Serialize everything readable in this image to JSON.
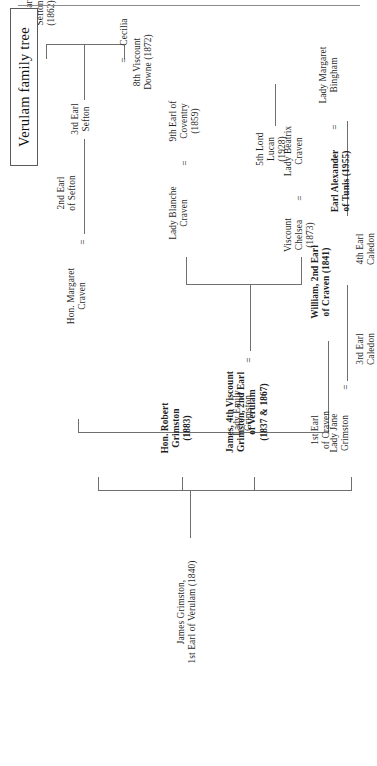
{
  "document": {
    "title": "Verulam family tree",
    "rule_color": "#8b8b8b",
    "line_color": "#6f6f6f",
    "text_color": "#1f1f1f",
    "orientation": "rotated-90-ccw"
  },
  "title_box": {
    "label": "Verulam family tree"
  },
  "nodes": {
    "james_grimston": {
      "line1": "James Grimston,",
      "line2": "1st Earl of Verulam (1840)"
    },
    "first_earl_craven": {
      "line1": "1st Earl",
      "line2": "of Craven"
    },
    "hon_margaret_craven": {
      "line1": "Hon. Margaret",
      "line2": "Craven"
    },
    "equals_margaret": {
      "symbol": "="
    },
    "second_earl_sefton": {
      "line1": "2nd Earl",
      "line2": "of Sefton"
    },
    "third_earl_sefton": {
      "line1": "3rd Earl",
      "line2": "Sefton"
    },
    "fourth_earl_sefton": {
      "line1": "4th Earl",
      "line2": "Sefton",
      "line3": "(1862)"
    },
    "eighth_viscount_downe": {
      "line1": "8th Viscount",
      "line2": "Downe (1872)"
    },
    "equals_cecilia": {
      "symbol": "="
    },
    "cecilia": {
      "line1": "Cecilia"
    },
    "lady_emily_grimston": {
      "line1": "Lady Emily",
      "line2": "Grimston"
    },
    "equals_emily": {
      "symbol": "="
    },
    "william_second_earl_craven": {
      "line1": "William, 2nd Earl",
      "line2": "of Craven (1841)"
    },
    "hon_robert_grimston": {
      "line1": "Hon. Robert",
      "line2": "Grimston",
      "line3": "(1883)"
    },
    "james_fourth_viscount": {
      "line1": "James, 4th Viscount",
      "line2": "Grimston, 2nd Earl",
      "line3": "of Verulam",
      "line4": "(1837 & 1867)"
    },
    "lady_jane_grimston": {
      "line1": "Lady Jane",
      "line2": "Grimston"
    },
    "equals_jane": {
      "symbol": "="
    },
    "third_earl_caledon": {
      "line1": "3rd Earl",
      "line2": "Caledon"
    },
    "fourth_earl_caledon": {
      "line1": "4th Earl",
      "line2": "Caledon"
    },
    "earl_alexander_tunis": {
      "line1": "Earl Alexander",
      "line2": "of Tunis (1955)"
    },
    "equals_alexander": {
      "symbol": "="
    },
    "lady_margaret_bingham": {
      "line1": "Lady Margaret",
      "line2": "Bingham"
    },
    "fifth_lord_lucan": {
      "line1": "5th Lord",
      "line2": "Lucan",
      "line3": "(1928)"
    },
    "lady_blanche_craven": {
      "line1": "Lady Blanche",
      "line2": "Craven"
    },
    "equals_blanche": {
      "symbol": "="
    },
    "ninth_earl_coventry": {
      "line1": "9th Earl of",
      "line2": "Coventry",
      "line3": "(1859)"
    },
    "viscount_chelsea": {
      "line1": "Viscount",
      "line2": "Chelsea",
      "line3": "(1873)"
    },
    "equals_chelsea": {
      "symbol": "="
    },
    "lady_beatrix_craven": {
      "line1": "Lady Beatrix",
      "line2": "Craven"
    }
  }
}
